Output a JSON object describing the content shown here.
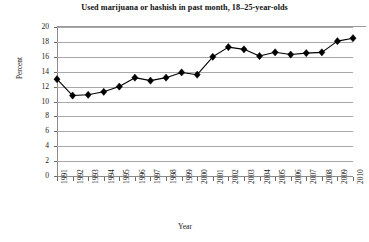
{
  "chart_data": {
    "type": "line",
    "title": "Used marijuana or hashish in past month, 18–25-year-olds",
    "xlabel": "Year",
    "ylabel": "Percent",
    "categories": [
      "1991",
      "1992",
      "1993",
      "1994",
      "1995",
      "1996",
      "1997",
      "1998",
      "1999",
      "2000",
      "2001",
      "2002",
      "2003",
      "2004",
      "2005",
      "2006",
      "2007",
      "2008",
      "2009",
      "2010"
    ],
    "values": [
      13.0,
      10.8,
      10.9,
      11.3,
      12.0,
      13.2,
      12.8,
      13.2,
      13.9,
      13.6,
      16.0,
      17.3,
      17.0,
      16.1,
      16.6,
      16.3,
      16.5,
      16.6,
      18.1,
      18.5
    ],
    "series": [
      {
        "name": "Used marijuana or hashish in past month",
        "values": [
          13.0,
          10.8,
          10.9,
          11.3,
          12.0,
          13.2,
          12.8,
          13.2,
          13.9,
          13.6,
          16.0,
          17.3,
          17.0,
          16.1,
          16.6,
          16.3,
          16.5,
          16.6,
          18.1,
          18.5
        ]
      }
    ],
    "yticks": [
      0,
      2,
      4,
      6,
      8,
      10,
      12,
      14,
      16,
      18,
      20
    ],
    "ylim": [
      0,
      20
    ],
    "xlim": [
      "1991",
      "2010"
    ],
    "grid": true,
    "legend": false,
    "marker": "diamond",
    "line_color": "#000000",
    "marker_color": "#000000",
    "grid_color": "#a8a8a8",
    "background_color": "#ffffff"
  }
}
